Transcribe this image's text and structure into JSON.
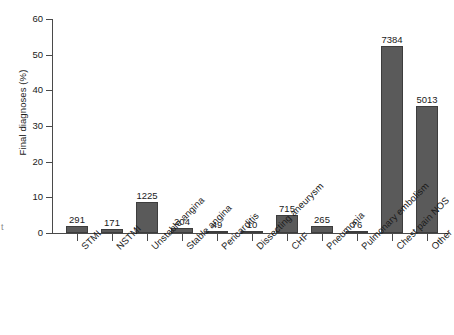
{
  "chart_data": {
    "type": "bar",
    "title": "",
    "subtitle": "",
    "xlabel": "",
    "ylabel": "Final diagnoses (%)",
    "ylim": [
      0,
      60
    ],
    "yticks": [
      0,
      10,
      20,
      30,
      40,
      50,
      60
    ],
    "grid": false,
    "legend": "none",
    "categories": [
      "STMI",
      "NSTMI",
      "Unstable angina",
      "Stable angina",
      "Pericarditis",
      "Dissecting aneurysm",
      "CHF",
      "Pneumonia",
      "Pulmonary embolism",
      "Chest pain NOS",
      "Other"
    ],
    "values": [
      2.1,
      1.2,
      8.7,
      1.4,
      0.4,
      0.1,
      5.1,
      1.9,
      0.6,
      52.4,
      35.6
    ],
    "point_labels": [
      "291",
      "171",
      "1225",
      "204",
      "49",
      "10",
      "715",
      "265",
      "76",
      "7384",
      "5013"
    ],
    "label_note": "counts shown above each bar; bar heights are percentages"
  },
  "axis": {
    "y_tick_labels": [
      "0",
      "10",
      "20",
      "30",
      "40",
      "50",
      "60"
    ],
    "y_axis_title": "Final diagnoses (%)"
  },
  "artifacts": {
    "left_margin_fragment": "t"
  },
  "colors": {
    "bar_fill": "#5a5a5a",
    "bar_stroke": "#3d3d3d",
    "axis": "#4a4a4a",
    "text": "#1a1a1a",
    "background": "#ffffff"
  }
}
